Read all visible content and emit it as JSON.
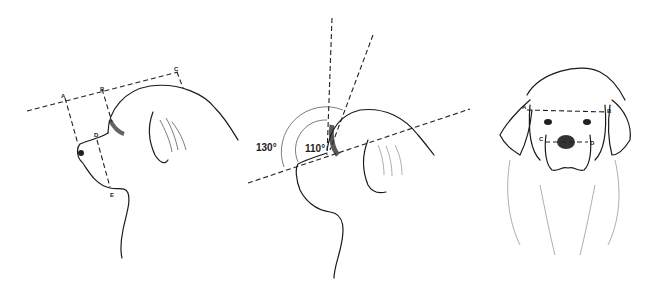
{
  "figure": {
    "panels": [
      {
        "id": "profile-measurements",
        "view": "side profile",
        "labels": [
          "A",
          "B",
          "C",
          "D",
          "E"
        ]
      },
      {
        "id": "profile-angles",
        "view": "side profile",
        "angles": [
          "130°",
          "110°"
        ]
      },
      {
        "id": "front-measurements",
        "view": "front",
        "labels": [
          "A",
          "B",
          "C",
          "D"
        ]
      }
    ]
  }
}
